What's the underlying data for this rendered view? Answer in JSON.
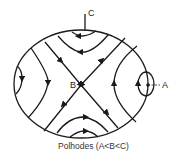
{
  "diagram": {
    "title": "Polhodes",
    "caption": "Polhodes   (A<B<C)",
    "labels": {
      "axis_c": "C",
      "axis_b": "B",
      "axis_a": "A"
    },
    "colors": {
      "stroke": "#1a1a1a",
      "background": "#ffffff"
    }
  }
}
